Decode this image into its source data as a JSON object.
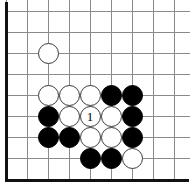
{
  "diagram": {
    "type": "go-board-position",
    "board": {
      "columns": 9,
      "rows": 8,
      "cell_size": 21,
      "origin_x": 6,
      "origin_y": 11,
      "stone_diameter": 21,
      "edges": {
        "left": "thick",
        "bottom": "thick",
        "top": "open",
        "right": "open"
      },
      "line_color": "#8a8a8a",
      "edge_color": "#111111",
      "background_color": "#ffffff"
    },
    "stone_colors": {
      "black": "#000000",
      "white": "#ffffff",
      "white_outline": "#3a3a3a"
    },
    "stones": [
      {
        "id": "w-c3r3",
        "color": "white",
        "col": 3,
        "row": 3,
        "label": ""
      },
      {
        "id": "w-c3r5",
        "color": "white",
        "col": 3,
        "row": 5,
        "label": ""
      },
      {
        "id": "w-c4r5",
        "color": "white",
        "col": 4,
        "row": 5,
        "label": ""
      },
      {
        "id": "w-c5r5",
        "color": "white",
        "col": 5,
        "row": 5,
        "label": ""
      },
      {
        "id": "b-c6r5",
        "color": "black",
        "col": 6,
        "row": 5,
        "label": ""
      },
      {
        "id": "b-c7r5",
        "color": "black",
        "col": 7,
        "row": 5,
        "label": ""
      },
      {
        "id": "b-c3r6",
        "color": "black",
        "col": 3,
        "row": 6,
        "label": ""
      },
      {
        "id": "w-c4r6",
        "color": "white",
        "col": 4,
        "row": 6,
        "label": ""
      },
      {
        "id": "w-c5r6",
        "color": "white",
        "col": 5,
        "row": 6,
        "label": "1"
      },
      {
        "id": "w-c6r6",
        "color": "white",
        "col": 6,
        "row": 6,
        "label": ""
      },
      {
        "id": "b-c7r6",
        "color": "black",
        "col": 7,
        "row": 6,
        "label": ""
      },
      {
        "id": "b-c3r7",
        "color": "black",
        "col": 3,
        "row": 7,
        "label": ""
      },
      {
        "id": "b-c4r7",
        "color": "black",
        "col": 4,
        "row": 7,
        "label": ""
      },
      {
        "id": "w-c5r7",
        "color": "white",
        "col": 5,
        "row": 7,
        "label": ""
      },
      {
        "id": "w-c6r7",
        "color": "white",
        "col": 6,
        "row": 7,
        "label": ""
      },
      {
        "id": "b-c7r7",
        "color": "black",
        "col": 7,
        "row": 7,
        "label": ""
      },
      {
        "id": "b-c5r8",
        "color": "black",
        "col": 5,
        "row": 8,
        "label": ""
      },
      {
        "id": "b-c6r8",
        "color": "black",
        "col": 6,
        "row": 8,
        "label": ""
      },
      {
        "id": "w-c7r8",
        "color": "white",
        "col": 7,
        "row": 8,
        "label": ""
      }
    ],
    "move_markers": [
      {
        "number": "1",
        "color": "white",
        "col": 5,
        "row": 6
      }
    ]
  }
}
